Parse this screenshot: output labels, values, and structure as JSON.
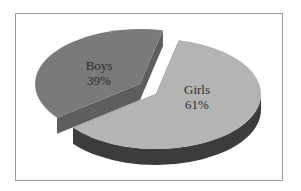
{
  "chart_data": {
    "type": "pie",
    "style": "3d-exploded",
    "title": "",
    "slices": [
      {
        "label": "Boys",
        "value": 39,
        "display": "39%",
        "color": "#7a7a7a",
        "side_color": "#5e5e5e"
      },
      {
        "label": "Girls",
        "value": 61,
        "display": "61%",
        "color": "#b4b4b4",
        "side_color": "#3c3c3c"
      }
    ],
    "legend": "none"
  }
}
